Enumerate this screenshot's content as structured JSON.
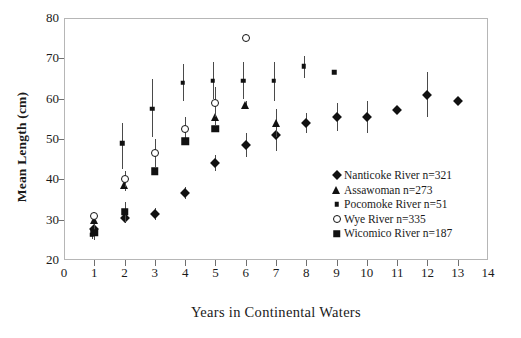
{
  "chart_data": {
    "type": "scatter",
    "title": "",
    "xlabel": "Years in Continental Waters",
    "ylabel": "Mean Length (cm)",
    "xlim": [
      0,
      14
    ],
    "ylim": [
      20,
      80
    ],
    "xticks": [
      0,
      1,
      2,
      3,
      4,
      5,
      6,
      7,
      8,
      9,
      10,
      11,
      12,
      13,
      14
    ],
    "yticks": [
      20,
      30,
      40,
      50,
      60,
      70,
      80
    ],
    "grid": false,
    "legend_position": "inside-lower-right",
    "error_bars": "vertical",
    "series": [
      {
        "name": "Nanticoke River n=321",
        "label": "Nanticoke River n=321",
        "marker": "filled-diamond",
        "color": "#111111",
        "points": [
          {
            "x": 1,
            "y": 27.8,
            "lo": 25.5,
            "hi": 30.2
          },
          {
            "x": 2,
            "y": 30.5,
            "lo": 29.2,
            "hi": 32.0
          },
          {
            "x": 3,
            "y": 31.5,
            "lo": 30.0,
            "hi": 33.0
          },
          {
            "x": 4,
            "y": 36.5,
            "lo": 35.0,
            "hi": 38.2
          },
          {
            "x": 5,
            "y": 44.0,
            "lo": 42.0,
            "hi": 46.0
          },
          {
            "x": 6,
            "y": 48.5,
            "lo": 45.5,
            "hi": 51.5
          },
          {
            "x": 7,
            "y": 51.0,
            "lo": 47.0,
            "hi": 55.0
          },
          {
            "x": 8,
            "y": 54.0,
            "lo": 51.5,
            "hi": 56.5
          },
          {
            "x": 9,
            "y": 55.5,
            "lo": 52.0,
            "hi": 59.0
          },
          {
            "x": 10,
            "y": 55.5,
            "lo": 51.5,
            "hi": 59.5
          },
          {
            "x": 11,
            "y": 57.3,
            "lo": 56.3,
            "hi": 58.3
          },
          {
            "x": 12,
            "y": 61.0,
            "lo": 55.5,
            "hi": 66.5
          },
          {
            "x": 13,
            "y": 59.3,
            "lo": 59.3,
            "hi": 59.3
          }
        ]
      },
      {
        "name": "Assawoman n=273",
        "label": "Assawoman n=273",
        "marker": "filled-triangle",
        "color": "#111111",
        "points": [
          {
            "x": 1,
            "y": 29.8,
            "lo": 28.2,
            "hi": 31.5
          },
          {
            "x": 2,
            "y": 38.5,
            "lo": 37.0,
            "hi": 40.0
          },
          {
            "x": 5,
            "y": 55.5,
            "lo": 53.5,
            "hi": 58.0
          },
          {
            "x": 6,
            "y": 58.5,
            "lo": 57.5,
            "hi": 59.5
          },
          {
            "x": 7,
            "y": 54.0,
            "lo": 50.5,
            "hi": 57.5
          }
        ]
      },
      {
        "name": "Pocomoke River n=51",
        "label": "Pocomoke River n=51",
        "marker": "small-filled-square",
        "color": "#111111",
        "points": [
          {
            "x": 1,
            "y": 26.2,
            "lo": 25.2,
            "hi": 27.2
          },
          {
            "x": 2,
            "y": 49.0,
            "lo": 42.5,
            "hi": 54.0
          },
          {
            "x": 3,
            "y": 57.5,
            "lo": 50.5,
            "hi": 65.0
          },
          {
            "x": 4,
            "y": 64.0,
            "lo": 59.5,
            "hi": 68.5
          },
          {
            "x": 5,
            "y": 64.5,
            "lo": 60.0,
            "hi": 69.0
          },
          {
            "x": 6,
            "y": 64.5,
            "lo": 60.0,
            "hi": 69.0
          },
          {
            "x": 7,
            "y": 64.5,
            "lo": 59.5,
            "hi": 69.0
          },
          {
            "x": 8,
            "y": 68.0,
            "lo": 65.0,
            "hi": 70.5
          },
          {
            "x": 9,
            "y": 66.5,
            "lo": 66.5,
            "hi": 66.5
          }
        ]
      },
      {
        "name": "Wye River n=335",
        "label": "Wye River n=335",
        "marker": "open-circle",
        "color": "#111111",
        "points": [
          {
            "x": 1,
            "y": 30.8,
            "lo": 30.0,
            "hi": 31.6
          },
          {
            "x": 2,
            "y": 40.0,
            "lo": 38.0,
            "hi": 42.0
          },
          {
            "x": 3,
            "y": 46.5,
            "lo": 43.0,
            "hi": 50.0
          },
          {
            "x": 4,
            "y": 52.5,
            "lo": 49.5,
            "hi": 55.5
          },
          {
            "x": 5,
            "y": 59.0,
            "lo": 55.5,
            "hi": 63.0
          },
          {
            "x": 6,
            "y": 75.0,
            "lo": 75.0,
            "hi": 75.0
          }
        ]
      },
      {
        "name": "Wicomico River n=187",
        "label": "Wicomico River n=187",
        "marker": "filled-square",
        "color": "#111111",
        "points": [
          {
            "x": 1,
            "y": 26.8,
            "lo": 25.0,
            "hi": 28.6
          },
          {
            "x": 2,
            "y": 32.0,
            "lo": 29.5,
            "hi": 34.5
          },
          {
            "x": 3,
            "y": 42.0,
            "lo": 42.0,
            "hi": 42.0
          },
          {
            "x": 4,
            "y": 49.5,
            "lo": 49.5,
            "hi": 49.5
          },
          {
            "x": 5,
            "y": 52.5,
            "lo": 52.5,
            "hi": 52.5
          }
        ]
      }
    ]
  }
}
